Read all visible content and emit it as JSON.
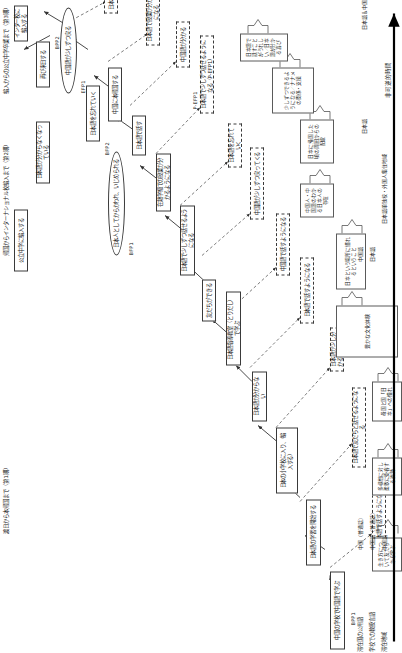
{
  "figure": {
    "timeline_label": "非可逆的時間",
    "phase_headers": [
      {
        "id": "ph1",
        "label": "渡日から本帰国まで（第1期）"
      },
      {
        "id": "ph2",
        "label": "帰国からインターナショナル校編入まで（第2期）"
      },
      {
        "id": "ph3",
        "label": "編入からの公立中学卒業まで（第3期）"
      }
    ],
    "stage_tags": [
      "BPP1",
      "BFP1",
      "BFP2",
      "EFP1",
      "BPP2",
      "EFP2"
    ],
    "row_labels": [
      "滞在地域",
      "学校での教授言語",
      "滞在国の公用語"
    ],
    "row_values": [
      [
        "中国（普通話）",
        "中国語（普通話）",
        "中国語"
      ],
      [
        "中国語",
        "中国語（普通話）",
        "中国語"
      ],
      [
        "日本語",
        "日本語",
        "日本語"
      ],
      [
        "日本語＆中国語",
        "日本語＆中国語",
        "日本語＆中国語"
      ]
    ],
    "axis_markers": [
      {
        "label": "中国語",
        "pos": "中国"
      },
      {
        "label": "日本語",
        "pos": "日本"
      },
      {
        "label": "日本語＆中国語",
        "pos": "日本・中国"
      },
      {
        "label": "日本語単独校・外国人集住地域",
        "pos": "日本"
      }
    ],
    "main_chain": [
      {
        "id": "n01",
        "shape": "rect",
        "text": "中国の学校で中国語で学ぶ"
      },
      {
        "id": "n02",
        "shape": "rect",
        "text": "日本語の学習を開始する"
      },
      {
        "id": "n03",
        "shape": "rect",
        "text": "日本の小学校に入り、（編入する）"
      },
      {
        "id": "n04",
        "shape": "rect",
        "text": "日本語が分からない"
      },
      {
        "id": "n05",
        "shape": "rect",
        "text": "日本語指導教室（とりだし）で学ぶ"
      },
      {
        "id": "n06",
        "shape": "rect",
        "text": "友だちができる"
      },
      {
        "id": "n07",
        "shape": "rect",
        "text": "日本語で少しずつ話せるようになる"
      },
      {
        "id": "n08",
        "shape": "rect",
        "text": "在籍学級での授業が分かるようになる"
      },
      {
        "id": "n09",
        "shape": "rect",
        "text": "日本語で話す"
      },
      {
        "id": "n10",
        "shape": "rect",
        "text": "中国に本帰国する"
      },
      {
        "id": "n11",
        "shape": "ell",
        "text": "日本人としてからかわれ、いじめられる"
      },
      {
        "id": "n12",
        "shape": "rect",
        "text": "日本語を忘れていく"
      },
      {
        "id": "n13",
        "shape": "ell",
        "text": "中国語が少しずつ戻る"
      },
      {
        "id": "n14",
        "shape": "rect",
        "text": "再び来日する"
      },
      {
        "id": "n15",
        "shape": "rect",
        "text": "日本語が分からなくなっている"
      },
      {
        "id": "n16",
        "shape": "rect",
        "text": "公立中学に編入する"
      },
      {
        "id": "n17",
        "shape": "rect",
        "text": "インター校に編入する"
      }
    ],
    "reflection_nodes": [
      {
        "id": "r01",
        "text": "日本語で話すようになる"
      },
      {
        "id": "r02",
        "text": "日本語で友だちと話せるようになる"
      },
      {
        "id": "r03",
        "text": "日本語が少し分かるようになる"
      },
      {
        "id": "r04",
        "text": "日本語で話すようになる"
      },
      {
        "id": "r05",
        "text": "中国語で話すようになる"
      },
      {
        "id": "r06",
        "text": "中国語が少しずつ戻ってくる"
      },
      {
        "id": "r07",
        "text": "日本語を忘れていく"
      },
      {
        "id": "r08",
        "text": "日本語で少しずつ話せるようになる（P-EFP1）"
      },
      {
        "id": "r09",
        "text": "中国語が分かる"
      },
      {
        "id": "r10",
        "text": "日本語で授業が分かるようになる"
      },
      {
        "id": "r11",
        "text": "日本語で進路を決めるようになる"
      }
    ],
    "brace_groups": [
      {
        "id": "b1",
        "text": "日本語で話すことがうれしい／日本語が分かる喜び"
      },
      {
        "id": "b2",
        "text": "日本に帰国した頃の周囲からの配慮"
      },
      {
        "id": "b3",
        "text": "中国人・中国語のわかる日本人の存在"
      },
      {
        "id": "b4",
        "text": "少しずつできるようになる／ナナメの関係・支援"
      },
      {
        "id": "b5",
        "text": "日本という場所に慣れるということ"
      },
      {
        "id": "b6",
        "text": "豊かな文化体験"
      },
      {
        "id": "b7",
        "text": "母国と国「日本」への憧れ"
      },
      {
        "id": "b8",
        "text": "多様性に対し柔軟に受容する姿勢"
      },
      {
        "id": "b9",
        "text": "生き方について友だちから学ぶ"
      }
    ],
    "annot_labels": [
      "P-EFP1",
      "P-EFP2"
    ]
  }
}
